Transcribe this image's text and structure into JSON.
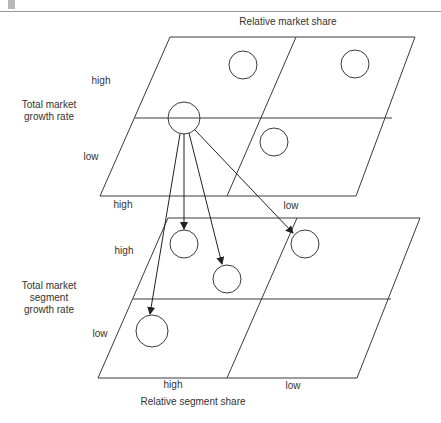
{
  "top_grid": {
    "title": "Relative market share",
    "y_axis_title": "Total market\ngrowth rate",
    "y_labels": [
      "high",
      "low"
    ],
    "x_labels": [
      "high",
      "low"
    ]
  },
  "bottom_grid": {
    "title": "Relative segment share",
    "y_axis_title": "Total market\nsegment\ngrowth rate",
    "y_labels": [
      "high",
      "low"
    ],
    "x_labels": [
      "high",
      "low"
    ]
  },
  "colors": {
    "line": "#3a3a3a",
    "text": "#333333",
    "background": "#ffffff"
  }
}
